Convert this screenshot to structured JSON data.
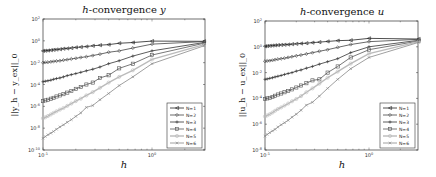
{
  "chart_data": [
    {
      "type": "line",
      "title": "h-convergence y",
      "title_italic_prefix": "h",
      "title_rest": "-convergence ",
      "title_var": "y",
      "xlabel": "h",
      "ylabel": "||y_h − y_ex||_0",
      "xscale": "log",
      "yscale": "log",
      "xlim": [
        0.1,
        3.0
      ],
      "ylim": [
        1e-10,
        100
      ],
      "x_ticks": [
        {
          "value": 0.1,
          "label": "10^-1"
        },
        {
          "value": 1,
          "label": "10^0"
        }
      ],
      "y_ticks": [
        {
          "value": 100,
          "label": "10^2"
        },
        {
          "value": 1,
          "label": "10^0"
        },
        {
          "value": 0.01,
          "label": "10^-2"
        },
        {
          "value": 0.0001,
          "label": "10^-4"
        },
        {
          "value": 1e-06,
          "label": "10^-6"
        },
        {
          "value": 1e-08,
          "label": "10^-8"
        },
        {
          "value": 1e-10,
          "label": "10^-10"
        }
      ],
      "grid": false,
      "legend_position": "lower right",
      "x": [
        3.0,
        1.0,
        0.667,
        0.5,
        0.4,
        0.333,
        0.286,
        0.25,
        0.222,
        0.2,
        0.182,
        0.167,
        0.154,
        0.143,
        0.133,
        0.125,
        0.118,
        0.111,
        0.105,
        0.1
      ],
      "series": [
        {
          "name": "N=1",
          "marker": "triangle-left",
          "color": "#222222",
          "values": [
            0.9,
            0.95,
            0.7,
            0.6,
            0.45,
            0.4,
            0.35,
            0.3,
            0.27,
            0.25,
            0.22,
            0.2,
            0.19,
            0.17,
            0.16,
            0.15,
            0.14,
            0.13,
            0.125,
            0.12
          ]
        },
        {
          "name": "N=2",
          "marker": "diamond",
          "color": "#444444",
          "values": [
            0.85,
            0.5,
            0.22,
            0.12,
            0.09,
            0.06,
            0.045,
            0.035,
            0.03,
            0.025,
            0.022,
            0.019,
            0.017,
            0.015,
            0.014,
            0.013,
            0.012,
            0.011,
            0.0105,
            0.01
          ]
        },
        {
          "name": "N=3",
          "marker": "plus",
          "color": "#333333",
          "values": [
            0.7,
            0.12,
            0.04,
            0.015,
            0.008,
            0.004,
            0.0025,
            0.0018,
            0.0013,
            0.001,
            0.0008,
            0.00065,
            0.0005,
            0.0004,
            0.00035,
            0.0003,
            0.00025,
            0.00022,
            0.0002,
            0.00018
          ]
        },
        {
          "name": "N=4",
          "marker": "square",
          "color": "#555555",
          "values": [
            0.6,
            0.05,
            0.008,
            0.003,
            0.0007,
            0.0004,
            0.00015,
            0.0001,
            6e-05,
            4e-05,
            2.5e-05,
            1.8e-05,
            1.3e-05,
            1e-05,
            8e-06,
            6e-06,
            5e-06,
            4e-06,
            3.5e-06,
            3e-06
          ]
        },
        {
          "name": "N=5",
          "marker": "circle",
          "color": "#bbbbbb",
          "values": [
            0.45,
            0.02,
            0.002,
            0.0005,
            0.00015,
            5e-05,
            2e-05,
            1e-05,
            5e-06,
            3e-06,
            1.8e-06,
            1.1e-06,
            7e-07,
            5e-07,
            3.5e-07,
            2.5e-07,
            1.8e-07,
            1.3e-07,
            1e-07,
            8e-08
          ]
        },
        {
          "name": "N=6",
          "marker": "x",
          "color": "#888888",
          "values": [
            0.35,
            0.008,
            0.0005,
            8e-05,
            1.5e-05,
            4e-06,
            1.2e-06,
            8e-07,
            2.5e-07,
            1.2e-07,
            6e-08,
            3.5e-08,
            2e-08,
            1.3e-08,
            8e-09,
            5e-09,
            3.5e-09,
            2.5e-09,
            1.7e-09,
            1.2e-09
          ]
        }
      ]
    },
    {
      "type": "line",
      "title": "h-convergence u",
      "title_italic_prefix": "h",
      "title_rest": "-convergence ",
      "title_var": "u",
      "xlabel": "h",
      "ylabel": "||u_h − u_ex||_0",
      "xscale": "log",
      "yscale": "log",
      "xlim": [
        0.1,
        3.0
      ],
      "ylim": [
        1e-08,
        100
      ],
      "x_ticks": [
        {
          "value": 0.1,
          "label": "10^-1"
        },
        {
          "value": 1,
          "label": "10^0"
        }
      ],
      "y_ticks": [
        {
          "value": 100,
          "label": "10^2"
        },
        {
          "value": 1,
          "label": "10^0"
        },
        {
          "value": 0.01,
          "label": "10^-2"
        },
        {
          "value": 0.0001,
          "label": "10^-4"
        },
        {
          "value": 1e-06,
          "label": "10^-6"
        },
        {
          "value": 1e-08,
          "label": "10^-8"
        }
      ],
      "grid": false,
      "legend_position": "lower right",
      "x": [
        3.0,
        1.0,
        0.667,
        0.5,
        0.4,
        0.333,
        0.286,
        0.25,
        0.222,
        0.2,
        0.182,
        0.167,
        0.154,
        0.143,
        0.133,
        0.125,
        0.118,
        0.111,
        0.105,
        0.1
      ],
      "series": [
        {
          "name": "N=1",
          "marker": "triangle-left",
          "color": "#222222",
          "values": [
            4.0,
            4.5,
            3.2,
            3.0,
            2.6,
            2.3,
            2.1,
            1.9,
            1.8,
            1.7,
            1.6,
            1.5,
            1.45,
            1.4,
            1.35,
            1.3,
            1.25,
            1.2,
            1.15,
            1.1
          ]
        },
        {
          "name": "N=2",
          "marker": "diamond",
          "color": "#444444",
          "values": [
            3.8,
            2.5,
            1.5,
            0.9,
            0.6,
            0.45,
            0.35,
            0.28,
            0.23,
            0.2,
            0.17,
            0.15,
            0.13,
            0.12,
            0.11,
            0.1,
            0.09,
            0.085,
            0.08,
            0.075
          ]
        },
        {
          "name": "N=3",
          "marker": "plus",
          "color": "#333333",
          "values": [
            3.2,
            1.0,
            0.35,
            0.12,
            0.07,
            0.045,
            0.03,
            0.022,
            0.016,
            0.013,
            0.01,
            0.0085,
            0.0072,
            0.006,
            0.0052,
            0.0046,
            0.004,
            0.0036,
            0.0032,
            0.003
          ]
        },
        {
          "name": "N=4",
          "marker": "square",
          "color": "#555555",
          "values": [
            2.8,
            0.6,
            0.15,
            0.03,
            0.01,
            0.003,
            0.0025,
            0.0015,
            0.001,
            0.0007,
            0.0005,
            0.00038,
            0.0003,
            0.00024,
            0.0002,
            0.00016,
            0.00013,
            0.00011,
            0.0001,
            9e-05
          ]
        },
        {
          "name": "N=5",
          "marker": "circle",
          "color": "#bbbbbb",
          "values": [
            2.5,
            0.3,
            0.05,
            0.012,
            0.004,
            0.0014,
            0.0006,
            0.0003,
            0.00015,
            9e-05,
            6e-05,
            4e-05,
            2.8e-05,
            2e-05,
            1.5e-05,
            1.1e-05,
            8e-06,
            6e-06,
            4.8e-06,
            4e-06
          ]
        },
        {
          "name": "N=6",
          "marker": "x",
          "color": "#888888",
          "values": [
            2.2,
            0.15,
            0.02,
            0.003,
            0.0006,
            0.00015,
            5e-05,
            3e-05,
            1.2e-05,
            6e-06,
            3.5e-06,
            2e-06,
            1.3e-06,
            9e-07,
            6e-07,
            4e-07,
            3e-07,
            2.2e-07,
            1.6e-07,
            1.2e-07
          ]
        }
      ]
    }
  ],
  "charts": {
    "left": {
      "title_h": "h",
      "title_rest": "-convergence ",
      "title_var": "y",
      "xlabel": "h",
      "ylabel": "||y_h − y_ex||_0",
      "x_tick_labels": [
        "10",
        "10"
      ],
      "x_tick_exps": [
        "-1",
        "0"
      ],
      "legend": [
        "N=1",
        "N=2",
        "N=3",
        "N=4",
        "N=5",
        "N=6"
      ]
    },
    "right": {
      "title_h": "h",
      "title_rest": "-convergence ",
      "title_var": "u",
      "xlabel": "h",
      "ylabel": "||u_h − u_ex||_0",
      "x_tick_labels": [
        "10",
        "10"
      ],
      "x_tick_exps": [
        "-1",
        "0"
      ],
      "legend": [
        "N=1",
        "N=2",
        "N=3",
        "N=4",
        "N=5",
        "N=6"
      ]
    }
  }
}
